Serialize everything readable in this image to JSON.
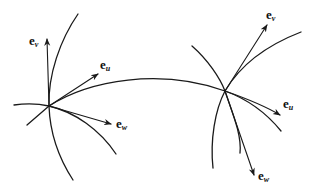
{
  "diagram": {
    "colors": {
      "stroke": "#1a1a1a",
      "background": "#ffffff"
    },
    "points": [
      {
        "id": "left",
        "labels": {
          "v": {
            "base": "e",
            "sub": "v"
          },
          "u": {
            "base": "e",
            "sub": "u"
          },
          "w": {
            "base": "e",
            "sub": "w"
          }
        }
      },
      {
        "id": "right",
        "labels": {
          "v": {
            "base": "e",
            "sub": "v"
          },
          "u": {
            "base": "e",
            "sub": "u"
          },
          "w": {
            "base": "e",
            "sub": "w"
          }
        }
      }
    ]
  }
}
